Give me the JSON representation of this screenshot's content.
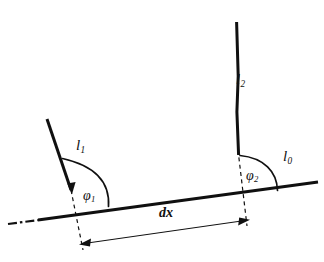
{
  "figure": {
    "kind": "geometry-diagram",
    "background_color": "#ffffff",
    "ink_color": "#101010",
    "width": 324,
    "height": 262
  },
  "labels": {
    "line_left": {
      "symbol": "l",
      "subscript": "1",
      "text": "l1"
    },
    "line_right": {
      "symbol": "l",
      "subscript": "2",
      "text": "l2"
    },
    "baseline": {
      "symbol": "l",
      "subscript": "0",
      "text": "l0"
    },
    "angle_left": {
      "symbol": "φ",
      "subscript": "1",
      "text": "φ1"
    },
    "angle_right": {
      "symbol": "φ",
      "subscript": "2",
      "text": "φ2"
    },
    "dimension": {
      "text": "dx"
    }
  },
  "geometry": {
    "baseline": {
      "x1": 38,
      "y1": 220,
      "x2": 318,
      "y2": 182,
      "stroke_width": 3.2
    },
    "baseline_extension": {
      "x1": 8,
      "y1": 224,
      "x2": 38,
      "y2": 220,
      "dash": "8,3,2,3"
    },
    "line_left": {
      "x1": 47,
      "y1": 120,
      "x2": 72,
      "y2": 193,
      "stroke_width": 3.0
    },
    "line_right": {
      "x1": 237,
      "y1": 22,
      "x2": 239,
      "y2": 155,
      "stroke_width": 3.0
    },
    "vertical_left": {
      "x1": 72,
      "y1": 193,
      "x2": 83,
      "y2": 246,
      "dash": "4,3"
    },
    "vertical_right": {
      "x1": 239,
      "y1": 155,
      "x2": 246,
      "y2": 222,
      "dash": "4,3"
    },
    "arc_left": {
      "cx": 72,
      "cy": 203,
      "radius": 40
    },
    "arc_right": {
      "cx": 239,
      "cy": 191,
      "radius": 36
    },
    "dimension_line": {
      "x1": 82,
      "y1": 244,
      "x2": 248,
      "y2": 220,
      "stroke_width": 1.0
    }
  }
}
